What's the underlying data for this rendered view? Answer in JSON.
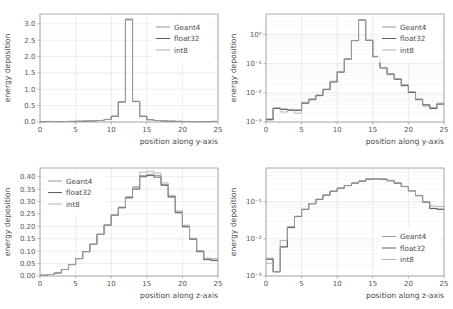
{
  "figure": {
    "background": "#ffffff",
    "grid": true,
    "legend_entries": [
      "Geant4",
      "float32",
      "int8"
    ],
    "series_colors": {
      "Geant4": "#8f8f8f",
      "float32": "#4d4d4d",
      "int8": "#a9a9a9"
    }
  },
  "chart_data": [
    {
      "type": "line",
      "panel": "top-left",
      "title": "",
      "xlabel": "position along y-axis",
      "ylabel": "energy deposition",
      "yscale": "linear",
      "xlim": [
        0,
        25
      ],
      "ylim": [
        0,
        3.3
      ],
      "xticks": [
        0,
        5,
        10,
        15,
        20,
        25
      ],
      "yticks": [
        0.0,
        0.5,
        1.0,
        1.5,
        2.0,
        2.5,
        3.0
      ],
      "ytick_labels": [
        "0.0",
        "0.5",
        "1.0",
        "1.5",
        "2.0",
        "2.5",
        "3.0"
      ],
      "xtick_labels": [
        "0",
        "5",
        "10",
        "15",
        "20",
        "25"
      ],
      "grid": true,
      "legend_position": "upper right",
      "bin_edges": [
        0,
        1,
        2,
        3,
        4,
        5,
        6,
        7,
        8,
        9,
        10,
        11,
        12,
        13,
        14,
        15,
        16,
        17,
        18,
        19,
        20,
        21,
        22,
        23,
        24,
        25
      ],
      "series": [
        {
          "name": "Geant4",
          "values": [
            0.012,
            0.016,
            0.013,
            0.015,
            0.018,
            0.022,
            0.026,
            0.032,
            0.046,
            0.078,
            0.175,
            0.62,
            3.15,
            0.63,
            0.175,
            0.072,
            0.044,
            0.03,
            0.024,
            0.019,
            0.016,
            0.014,
            0.013,
            0.014,
            0.017
          ]
        },
        {
          "name": "float32",
          "values": [
            0.011,
            0.015,
            0.014,
            0.014,
            0.017,
            0.021,
            0.025,
            0.031,
            0.045,
            0.076,
            0.172,
            0.61,
            3.12,
            0.625,
            0.172,
            0.071,
            0.043,
            0.029,
            0.023,
            0.018,
            0.015,
            0.013,
            0.012,
            0.013,
            0.016
          ]
        },
        {
          "name": "int8",
          "values": [
            0.01,
            0.018,
            0.012,
            0.016,
            0.019,
            0.023,
            0.027,
            0.033,
            0.047,
            0.08,
            0.178,
            0.615,
            3.13,
            0.635,
            0.178,
            0.073,
            0.045,
            0.031,
            0.025,
            0.02,
            0.017,
            0.015,
            0.012,
            0.012,
            0.018
          ]
        }
      ]
    },
    {
      "type": "line",
      "panel": "top-right",
      "title": "",
      "xlabel": "position along y-axis",
      "ylabel": "energy deposition",
      "yscale": "log",
      "xlim": [
        0,
        25
      ],
      "ylim": [
        0.001,
        5
      ],
      "xticks": [
        0,
        5,
        10,
        15,
        20,
        25
      ],
      "yticks": [
        0.001,
        0.01,
        0.1,
        1
      ],
      "ytick_labels": [
        "10⁻³",
        "10⁻²",
        "10⁻¹",
        "10⁰"
      ],
      "xtick_labels": [
        "0",
        "5",
        "10",
        "15",
        "20",
        "25"
      ],
      "grid": true,
      "legend_position": "upper right",
      "bin_edges": [
        0,
        1,
        2,
        3,
        4,
        5,
        6,
        7,
        8,
        9,
        10,
        11,
        12,
        13,
        14,
        15,
        16,
        17,
        18,
        19,
        20,
        21,
        22,
        23,
        24,
        25
      ],
      "series": [
        {
          "name": "Geant4",
          "values": [
            0.0012,
            0.003,
            0.0028,
            0.0026,
            0.0026,
            0.0045,
            0.006,
            0.0082,
            0.013,
            0.024,
            0.052,
            0.145,
            0.62,
            3.15,
            0.63,
            0.175,
            0.072,
            0.044,
            0.03,
            0.018,
            0.0105,
            0.006,
            0.004,
            0.003,
            0.0042
          ]
        },
        {
          "name": "float32",
          "values": [
            0.0012,
            0.0029,
            0.0027,
            0.0025,
            0.0025,
            0.0044,
            0.0058,
            0.008,
            0.0128,
            0.0235,
            0.051,
            0.143,
            0.61,
            3.12,
            0.625,
            0.172,
            0.071,
            0.043,
            0.029,
            0.0175,
            0.0102,
            0.0058,
            0.0038,
            0.0029,
            0.0041
          ]
        },
        {
          "name": "int8",
          "values": [
            0.0013,
            0.0031,
            0.0022,
            0.0027,
            0.002,
            0.0047,
            0.0062,
            0.0085,
            0.0135,
            0.025,
            0.054,
            0.148,
            0.615,
            3.13,
            0.635,
            0.178,
            0.073,
            0.045,
            0.031,
            0.019,
            0.011,
            0.0062,
            0.0035,
            0.0032,
            0.0044
          ]
        }
      ]
    },
    {
      "type": "line",
      "panel": "bottom-left",
      "title": "",
      "xlabel": "position along z-axis",
      "ylabel": "energy deposition",
      "yscale": "linear",
      "xlim": [
        0,
        25
      ],
      "ylim": [
        0,
        0.435
      ],
      "xticks": [
        0,
        5,
        10,
        15,
        20,
        25
      ],
      "yticks": [
        0.0,
        0.05,
        0.1,
        0.15,
        0.2,
        0.25,
        0.3,
        0.35,
        0.4
      ],
      "ytick_labels": [
        "0.00",
        "0.05",
        "0.10",
        "0.15",
        "0.20",
        "0.25",
        "0.30",
        "0.35",
        "0.40"
      ],
      "xtick_labels": [
        "0",
        "5",
        "10",
        "15",
        "20",
        "25"
      ],
      "grid": true,
      "legend_position": "upper left",
      "bin_edges": [
        0,
        1,
        2,
        3,
        4,
        5,
        6,
        7,
        8,
        9,
        10,
        11,
        12,
        13,
        14,
        15,
        16,
        17,
        18,
        19,
        20,
        21,
        22,
        23,
        24,
        25
      ],
      "series": [
        {
          "name": "Geant4",
          "values": [
            0.003,
            0.006,
            0.012,
            0.026,
            0.046,
            0.07,
            0.098,
            0.128,
            0.168,
            0.205,
            0.245,
            0.275,
            0.315,
            0.355,
            0.405,
            0.41,
            0.405,
            0.368,
            0.32,
            0.258,
            0.2,
            0.15,
            0.1,
            0.068,
            0.065
          ]
        },
        {
          "name": "float32",
          "values": [
            0.003,
            0.006,
            0.012,
            0.026,
            0.046,
            0.07,
            0.098,
            0.128,
            0.168,
            0.205,
            0.245,
            0.275,
            0.315,
            0.35,
            0.4,
            0.405,
            0.398,
            0.365,
            0.318,
            0.255,
            0.198,
            0.148,
            0.098,
            0.066,
            0.062
          ]
        },
        {
          "name": "int8",
          "values": [
            0.003,
            0.006,
            0.012,
            0.026,
            0.046,
            0.07,
            0.098,
            0.128,
            0.168,
            0.205,
            0.245,
            0.278,
            0.32,
            0.36,
            0.418,
            0.422,
            0.415,
            0.375,
            0.325,
            0.262,
            0.205,
            0.152,
            0.102,
            0.072,
            0.07
          ]
        }
      ]
    },
    {
      "type": "line",
      "panel": "bottom-right",
      "title": "",
      "xlabel": "position along z-axis",
      "ylabel": "energy deposition",
      "yscale": "log",
      "xlim": [
        0,
        25
      ],
      "ylim": [
        0.001,
        0.8
      ],
      "xticks": [
        0,
        5,
        10,
        15,
        20,
        25
      ],
      "yticks": [
        0.001,
        0.01,
        0.1
      ],
      "ytick_labels": [
        "10⁻³",
        "10⁻²",
        "10⁻¹"
      ],
      "xtick_labels": [
        "0",
        "5",
        "10",
        "15",
        "20",
        "25"
      ],
      "grid": true,
      "legend_position": "lower right",
      "bin_edges": [
        0,
        1,
        2,
        3,
        4,
        5,
        6,
        7,
        8,
        9,
        10,
        11,
        12,
        13,
        14,
        15,
        16,
        17,
        18,
        19,
        20,
        21,
        22,
        23,
        24,
        25
      ],
      "series": [
        {
          "name": "Geant4",
          "values": [
            0.003,
            0.0013,
            0.0062,
            0.0205,
            0.04,
            0.062,
            0.088,
            0.115,
            0.15,
            0.19,
            0.23,
            0.27,
            0.315,
            0.355,
            0.405,
            0.41,
            0.4,
            0.365,
            0.315,
            0.255,
            0.195,
            0.145,
            0.098,
            0.066,
            0.063
          ]
        },
        {
          "name": "float32",
          "values": [
            0.0028,
            0.0013,
            0.006,
            0.02,
            0.0395,
            0.0615,
            0.0875,
            0.1145,
            0.1495,
            0.189,
            0.229,
            0.269,
            0.314,
            0.353,
            0.402,
            0.407,
            0.398,
            0.363,
            0.313,
            0.2535,
            0.194,
            0.144,
            0.097,
            0.065,
            0.062
          ]
        },
        {
          "name": "int8",
          "values": [
            0.0022,
            0.0013,
            0.009,
            0.0215,
            0.0405,
            0.0625,
            0.0885,
            0.116,
            0.151,
            0.191,
            0.231,
            0.272,
            0.318,
            0.36,
            0.415,
            0.42,
            0.41,
            0.372,
            0.32,
            0.258,
            0.198,
            0.147,
            0.1,
            0.076,
            0.074
          ]
        }
      ]
    }
  ]
}
